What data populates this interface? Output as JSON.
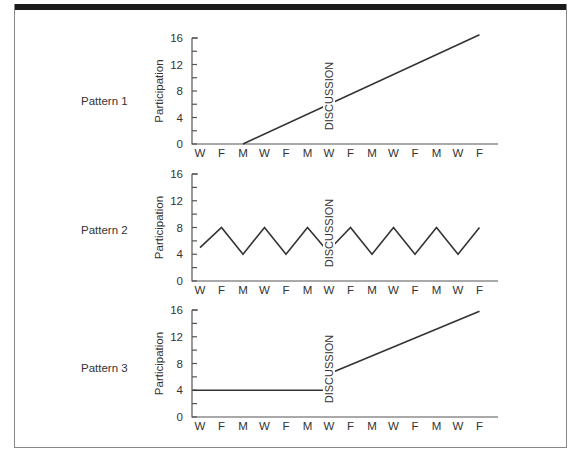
{
  "chart_data": [
    {
      "type": "line",
      "title": "Pattern 1",
      "xlabel": "",
      "ylabel": "Participation",
      "ylim": [
        0,
        16
      ],
      "yticks": [
        0,
        4,
        8,
        12,
        16
      ],
      "categories": [
        "W",
        "F",
        "M",
        "W",
        "F",
        "M",
        "W",
        "F",
        "M",
        "W",
        "F",
        "M",
        "W",
        "F"
      ],
      "annotation": {
        "text": "DISCUSSION",
        "at_category_index": 6
      },
      "series": [
        {
          "name": "Participation",
          "segments": [
            {
              "x": [
                2,
                13
              ],
              "values": [
                0,
                16.5
              ]
            }
          ]
        }
      ],
      "grid": false
    },
    {
      "type": "line",
      "title": "Pattern 2",
      "xlabel": "",
      "ylabel": "Participation",
      "ylim": [
        0,
        16
      ],
      "yticks": [
        0,
        4,
        8,
        12,
        16
      ],
      "categories": [
        "W",
        "F",
        "M",
        "W",
        "F",
        "M",
        "W",
        "F",
        "M",
        "W",
        "F",
        "M",
        "W",
        "F"
      ],
      "annotation": {
        "text": "DISCUSSION",
        "at_category_index": 6
      },
      "series": [
        {
          "name": "Participation",
          "segments": [
            {
              "x": [
                0,
                1,
                2,
                3,
                4,
                5,
                5.85
              ],
              "values": [
                5,
                8,
                4,
                8,
                4,
                8,
                4.8
              ]
            },
            {
              "x": [
                6.25,
                7,
                8,
                9,
                10,
                11,
                12,
                13
              ],
              "values": [
                5.5,
                8,
                4,
                8,
                4,
                8,
                4,
                8
              ]
            }
          ]
        }
      ],
      "grid": false
    },
    {
      "type": "line",
      "title": "Pattern 3",
      "xlabel": "",
      "ylabel": "Participation",
      "ylim": [
        0,
        16
      ],
      "yticks": [
        0,
        4,
        8,
        12,
        16
      ],
      "categories": [
        "W",
        "F",
        "M",
        "W",
        "F",
        "M",
        "W",
        "F",
        "M",
        "W",
        "F",
        "M",
        "W",
        "F"
      ],
      "annotation": {
        "text": "DISCUSSION",
        "at_category_index": 6
      },
      "series": [
        {
          "name": "Participation",
          "segments": [
            {
              "x": [
                -0.35,
                5.85
              ],
              "values": [
                4,
                4
              ]
            },
            {
              "x": [
                6.25,
                13
              ],
              "values": [
                6.8,
                15.8
              ]
            }
          ]
        }
      ],
      "grid": false
    }
  ],
  "colors": {
    "line": "#333333",
    "axis": "#555555",
    "frame_bar": "#1a1a1a",
    "frame_border": "#888888"
  }
}
